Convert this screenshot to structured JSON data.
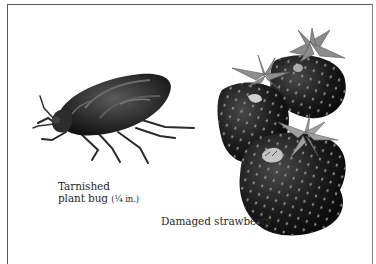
{
  "figure": {
    "bug": {
      "icon": "tarnished-plant-bug-illustration",
      "caption_line1": "Tarnished",
      "caption_line2_name": "plant bug",
      "caption_line2_size": "(¼ in.)"
    },
    "strawberry": {
      "icon": "damaged-strawberry-illustration",
      "caption": "Damaged strawberry"
    }
  }
}
